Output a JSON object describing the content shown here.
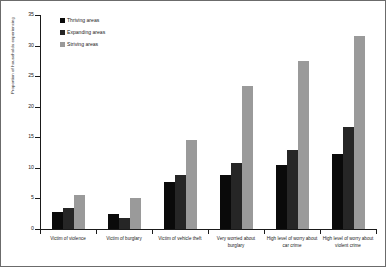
{
  "chart_data": {
    "type": "bar",
    "title": "",
    "xlabel": "",
    "ylabel": "Proportion of households experiencing",
    "ylim": [
      0,
      35
    ],
    "yticks": [
      0,
      5,
      10,
      15,
      20,
      25,
      30,
      35
    ],
    "grid": false,
    "legend_position": "top-left",
    "categories": [
      "Victim of violence",
      "Victim of burglary",
      "Victim of vehicle theft",
      "Very worried about burglary",
      "High level of worry about car crime",
      "High level of worry about violent crime"
    ],
    "series": [
      {
        "name": "Thriving areas",
        "color": "#0a0a0a",
        "values": [
          2.8,
          2.5,
          7.7,
          8.9,
          10.4,
          12.2
        ]
      },
      {
        "name": "Expanding areas",
        "color": "#262626",
        "values": [
          3.4,
          1.8,
          8.9,
          10.8,
          13.0,
          16.7
        ]
      },
      {
        "name": "Striving areas",
        "color": "#9a9a9a",
        "values": [
          5.6,
          5.0,
          14.6,
          23.4,
          27.4,
          31.6
        ]
      }
    ]
  }
}
